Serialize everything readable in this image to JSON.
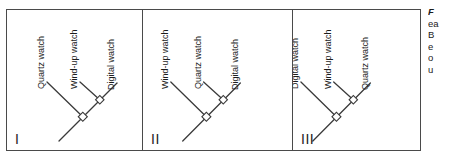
{
  "figure": {
    "panels": [
      {
        "numeral": "I",
        "tips": [
          {
            "label": "Quartz watch"
          },
          {
            "label": "Wind-up watch"
          },
          {
            "label": "Digital watch"
          }
        ]
      },
      {
        "numeral": "II",
        "tips": [
          {
            "label": "Wind-up watch"
          },
          {
            "label": "Quartz watch"
          },
          {
            "label": "Digital watch"
          }
        ]
      },
      {
        "numeral": "III",
        "tips": [
          {
            "label": "Digital watch"
          },
          {
            "label": "Wind-up watch"
          },
          {
            "label": "Quartz watch"
          }
        ]
      }
    ],
    "caption": {
      "lead": "F",
      "lines": [
        "ea",
        "B",
        "e",
        "o",
        "u"
      ]
    },
    "colors": {
      "line": "#3a3a3a",
      "border": "#4a4a4a",
      "text": "#1c1c1c",
      "background": "#ffffff"
    }
  }
}
